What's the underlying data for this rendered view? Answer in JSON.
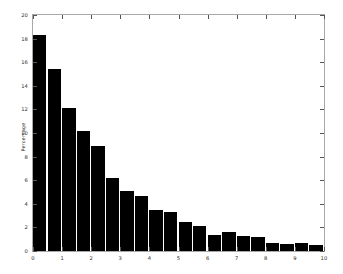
{
  "chart_data": {
    "type": "bar",
    "title": "",
    "subtitle": "",
    "xlabel": "",
    "ylabel": "Percentage",
    "xlim": [
      0,
      10
    ],
    "ylim": [
      0,
      20
    ],
    "grid": false,
    "legend": null,
    "bar_color": "#000000",
    "background_color": "#ffffff",
    "axis_color": "#a8a8a8",
    "bar_width": 0.5,
    "x_ticks": [
      0,
      1,
      2,
      3,
      4,
      5,
      6,
      7,
      8,
      9,
      10
    ],
    "x_tick_labels": [
      "0",
      "1",
      "2",
      "3",
      "4",
      "5",
      "6",
      "7",
      "8",
      "9",
      "10"
    ],
    "y_ticks": [
      0,
      2,
      4,
      6,
      8,
      10,
      12,
      14,
      16,
      18,
      20
    ],
    "y_tick_labels": [
      "0",
      "2",
      "4",
      "6",
      "8",
      "10",
      "12",
      "14",
      "16",
      "18",
      "20"
    ],
    "x": [
      0.0,
      0.5,
      1.0,
      1.5,
      2.0,
      2.5,
      3.0,
      3.5,
      4.0,
      4.5,
      5.0,
      5.5,
      6.0,
      6.5,
      7.0,
      7.5,
      8.0,
      8.5,
      9.0,
      9.5
    ],
    "categories": [
      "0.0",
      "0.5",
      "1.0",
      "1.5",
      "2.0",
      "2.5",
      "3.0",
      "3.5",
      "4.0",
      "4.5",
      "5.0",
      "5.5",
      "6.0",
      "6.5",
      "7.0",
      "7.5",
      "8.0",
      "8.5",
      "9.0",
      "9.5"
    ],
    "values": [
      18.3,
      15.4,
      12.1,
      10.2,
      8.9,
      6.2,
      5.1,
      4.7,
      3.5,
      3.3,
      2.5,
      2.1,
      1.35,
      1.6,
      1.3,
      1.2,
      0.65,
      0.6,
      0.65,
      0.55
    ]
  },
  "extra_values": {
    "tail": [
      0.6,
      0.3,
      0.3,
      1.1
    ]
  }
}
